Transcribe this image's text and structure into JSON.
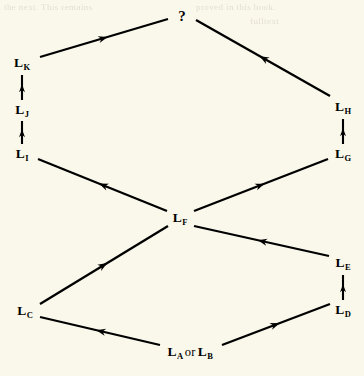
{
  "figure": {
    "background_color": "#faf8ea",
    "ink_color": "#000000",
    "width": 364,
    "height": 376
  },
  "bleed_through": {
    "line_a": "the next. This remains",
    "line_b": "proved in this book.",
    "line_c": "fulltext"
  },
  "nodes": [
    {
      "id": "unknown",
      "label": "?",
      "base": "",
      "sub": "",
      "x": 182,
      "y": 16
    },
    {
      "id": "LK",
      "label": "L",
      "base": "L",
      "sub": "K",
      "x": 22,
      "y": 63
    },
    {
      "id": "LJ",
      "label": "L",
      "base": "L",
      "sub": "J",
      "x": 22,
      "y": 110
    },
    {
      "id": "LI",
      "label": "L",
      "base": "L",
      "sub": "I",
      "x": 22,
      "y": 154
    },
    {
      "id": "LH",
      "label": "L",
      "base": "L",
      "sub": "H",
      "x": 343,
      "y": 107
    },
    {
      "id": "LG",
      "label": "L",
      "base": "L",
      "sub": "G",
      "x": 343,
      "y": 154
    },
    {
      "id": "LF",
      "label": "L",
      "base": "L",
      "sub": "F",
      "x": 180,
      "y": 218
    },
    {
      "id": "LE",
      "label": "L",
      "base": "L",
      "sub": "E",
      "x": 343,
      "y": 263
    },
    {
      "id": "LD",
      "label": "L",
      "base": "L",
      "sub": "D",
      "x": 343,
      "y": 310
    },
    {
      "id": "LC",
      "label": "L",
      "base": "L",
      "sub": "C",
      "x": 25,
      "y": 311
    },
    {
      "id": "LAB",
      "label": "L_A or L_B",
      "base": "L",
      "sub": "A",
      "conj": "or",
      "base2": "L",
      "sub2": "B",
      "x": 190,
      "y": 352
    }
  ],
  "edges": [
    {
      "id": "LK-unknown",
      "from": "LK",
      "to": "unknown",
      "x1": 40,
      "y1": 57,
      "x2": 168,
      "y2": 19,
      "style": "arrow-long"
    },
    {
      "id": "LH-unknown",
      "from": "LH",
      "to": "unknown",
      "x1": 330,
      "y1": 96,
      "x2": 196,
      "y2": 20,
      "style": "arrow-long"
    },
    {
      "id": "LJ-LK",
      "from": "LJ",
      "to": "LK",
      "x1": 22,
      "y1": 100,
      "x2": 22,
      "y2": 75,
      "style": "arrow-short"
    },
    {
      "id": "LI-LJ",
      "from": "LI",
      "to": "LJ",
      "x1": 22,
      "y1": 144,
      "x2": 22,
      "y2": 121,
      "style": "arrow-short"
    },
    {
      "id": "LG-LH",
      "from": "LG",
      "to": "LH",
      "x1": 343,
      "y1": 144,
      "x2": 343,
      "y2": 119,
      "style": "arrow-short"
    },
    {
      "id": "LF-LI",
      "from": "LF",
      "to": "LI",
      "x1": 167,
      "y1": 211,
      "x2": 38,
      "y2": 159,
      "style": "arrow-long"
    },
    {
      "id": "LF-LG",
      "from": "LF",
      "to": "LG",
      "x1": 194,
      "y1": 211,
      "x2": 328,
      "y2": 159,
      "style": "arrow-long"
    },
    {
      "id": "LC-LF",
      "from": "LC",
      "to": "LF",
      "x1": 40,
      "y1": 304,
      "x2": 168,
      "y2": 226,
      "style": "arrow-long"
    },
    {
      "id": "LE-LF",
      "from": "LE",
      "to": "LF",
      "x1": 329,
      "y1": 256,
      "x2": 194,
      "y2": 226,
      "style": "arrow-long"
    },
    {
      "id": "LD-LE",
      "from": "LD",
      "to": "LE",
      "x1": 343,
      "y1": 300,
      "x2": 343,
      "y2": 275,
      "style": "arrow-short"
    },
    {
      "id": "LAB-LC",
      "from": "LAB",
      "to": "LC",
      "x1": 160,
      "y1": 345,
      "x2": 40,
      "y2": 317,
      "style": "arrow-long"
    },
    {
      "id": "LAB-LD",
      "from": "LAB",
      "to": "LD",
      "x1": 222,
      "y1": 345,
      "x2": 330,
      "y2": 304,
      "style": "arrow-long"
    }
  ]
}
